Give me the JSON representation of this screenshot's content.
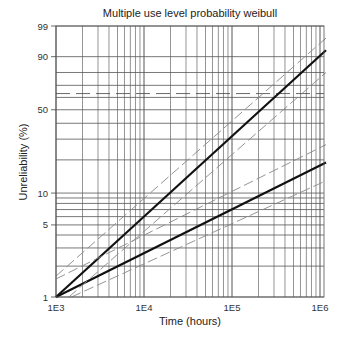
{
  "chart_data": {
    "type": "line",
    "title": "Multiple use level probability weibull",
    "xlabel": "Time (hours)",
    "ylabel": "Unreliability (%)",
    "x_scale": "log",
    "y_scale": "weibull",
    "xlim": [
      1000,
      1170000
    ],
    "ylim": [
      1,
      99
    ],
    "x_ticks": [
      {
        "value": 1000,
        "label": "1E3"
      },
      {
        "value": 10000,
        "label": "1E4"
      },
      {
        "value": 100000,
        "label": "1E5"
      },
      {
        "value": 1000000,
        "label": "1E6"
      }
    ],
    "y_ticks": [
      {
        "value": 1,
        "label": "1"
      },
      {
        "value": 5,
        "label": "5"
      },
      {
        "value": 10,
        "label": "10"
      },
      {
        "value": 50,
        "label": "50"
      },
      {
        "value": 90,
        "label": "90"
      },
      {
        "value": 99,
        "label": "99"
      }
    ],
    "grid": true,
    "legend": null,
    "series": [
      {
        "name": "Use level 1 (fitted line)",
        "style": "solid-bold",
        "color": "#111111",
        "x": [
          1000,
          1170000
        ],
        "y": [
          1,
          93
        ]
      },
      {
        "name": "Use level 2 (fitted line)",
        "style": "solid-bold",
        "color": "#111111",
        "x": [
          1000,
          1170000
        ],
        "y": [
          1,
          19
        ]
      },
      {
        "name": "Use level 1 upper bound",
        "style": "dashed",
        "color": "#888888",
        "x": [
          1000,
          1170000
        ],
        "y": [
          1.6,
          97
        ]
      },
      {
        "name": "Use level 1 lower bound",
        "style": "dashed",
        "color": "#888888",
        "x": [
          1400,
          1170000
        ],
        "y": [
          1,
          80
        ]
      },
      {
        "name": "Use level 2 upper bound",
        "style": "dashed",
        "color": "#888888",
        "x": [
          1000,
          1170000
        ],
        "y": [
          1.5,
          27
        ]
      },
      {
        "name": "Use level 2 lower bound",
        "style": "dashed",
        "color": "#888888",
        "x": [
          1500,
          1170000
        ],
        "y": [
          1,
          13
        ]
      }
    ],
    "reference_lines": [
      {
        "orientation": "horizontal",
        "value": 63.2,
        "style": "dashed"
      }
    ]
  }
}
